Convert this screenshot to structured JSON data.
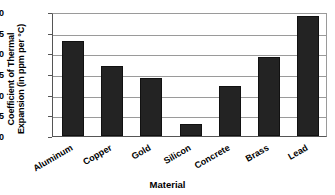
{
  "chart_data": {
    "type": "bar",
    "title": "",
    "xlabel": "Material",
    "ylabel": "Coefficient of Thermal Expansion (in ppm per °C)",
    "ylabel_lines": [
      "Coefficient of Thermal",
      "Expansion (in ppm per °C)"
    ],
    "categories": [
      "Aluminum",
      "Copper",
      "Gold",
      "Silicon",
      "Concrete",
      "Brass",
      "Lead"
    ],
    "values": [
      23,
      17,
      14,
      3,
      12,
      19,
      29
    ],
    "ylim": [
      0,
      30
    ],
    "yticks": [
      0,
      5,
      10,
      15,
      20,
      25,
      30
    ],
    "ytick_labels": [
      "0",
      "5",
      "10",
      "15",
      "20",
      "25",
      "30"
    ],
    "grid": true,
    "grid_axis": "y",
    "legend": false,
    "bar_color": "#232323",
    "grid_color": "#9a9a9a",
    "axis_color": "#555555",
    "background": "#ffffff",
    "xtick_label_rotation": -30
  }
}
